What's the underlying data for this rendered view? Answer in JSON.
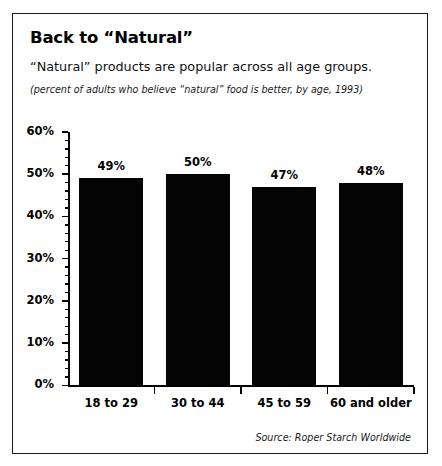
{
  "figure": {
    "title": "Back to “Natural”",
    "subtitle": "“Natural” products are popular across all age groups.",
    "note": "(percent of adults who believe “natural” food is better, by age, 1993)",
    "source": "Source: Roper Starch Worldwide",
    "border_color": "#1a1a1a",
    "bar_color": "#050505",
    "background": "#ffffff"
  },
  "chart_data": {
    "type": "bar",
    "title": "Back to “Natural”",
    "subtitle": "“Natural” products are popular across all age groups.",
    "annotation": "(percent of adults who believe “natural” food is better, by age, 1993)",
    "source": "Source: Roper Starch Worldwide",
    "categories": [
      "18 to 29",
      "30 to 44",
      "45 to 59",
      "60 and older"
    ],
    "values": [
      49,
      50,
      47,
      48
    ],
    "value_labels": [
      "49%",
      "50%",
      "47%",
      "48%"
    ],
    "xlabel": "",
    "ylabel": "",
    "ylim": [
      0,
      60
    ],
    "ytick_values": [
      0,
      10,
      20,
      30,
      40,
      50,
      60
    ],
    "ytick_labels": [
      "0%",
      "10%",
      "20%",
      "30%",
      "40%",
      "50%",
      "60%"
    ],
    "minor_tick_step": 2,
    "grid": false,
    "legend": false,
    "bar_color": "#050505",
    "units": "percent"
  }
}
